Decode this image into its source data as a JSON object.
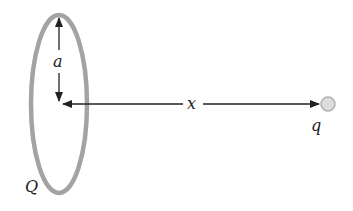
{
  "diagram": {
    "ring_label": "Q",
    "radius_label": "a",
    "distance_label": "x",
    "charge_label": "q",
    "colors": {
      "ring": "#a3a3a3",
      "arrow": "#222222",
      "charge_fill": "#dcdcdc",
      "charge_stroke": "#b0b0b0"
    }
  }
}
